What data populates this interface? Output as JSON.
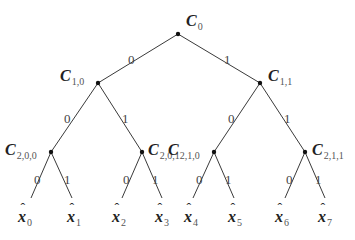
{
  "diagram": {
    "type": "binary-tree",
    "root": {
      "name": "C",
      "sub": "0",
      "x": 178,
      "y": 34,
      "lx": 186,
      "ly": 26
    },
    "level1": [
      {
        "name": "C",
        "sub": "1,0",
        "x": 98,
        "y": 83,
        "lx": 60,
        "ly": 81
      },
      {
        "name": "C",
        "sub": "1,1",
        "x": 260,
        "y": 83,
        "lx": 268,
        "ly": 81
      }
    ],
    "level2": [
      {
        "name": "C",
        "sub": "2,0,0",
        "x": 51,
        "y": 152,
        "lx": 5,
        "ly": 155
      },
      {
        "name": "C",
        "sub": "2,0,1",
        "x": 142,
        "y": 152,
        "lx": 148,
        "ly": 155
      },
      {
        "name": "C",
        "sub": "2,1,0",
        "x": 214,
        "y": 152,
        "lx": 168,
        "ly": 155
      },
      {
        "name": "C",
        "sub": "2,1,1",
        "x": 305,
        "y": 152,
        "lx": 312,
        "ly": 155
      }
    ],
    "leaves": [
      {
        "name": "x",
        "sub": "0",
        "x": 31,
        "y": 198,
        "lx": 18,
        "ly": 222
      },
      {
        "name": "x",
        "sub": "1",
        "x": 72,
        "y": 198,
        "lx": 67,
        "ly": 222
      },
      {
        "name": "x",
        "sub": "2",
        "x": 122,
        "y": 198,
        "lx": 112,
        "ly": 222
      },
      {
        "name": "x",
        "sub": "3",
        "x": 162,
        "y": 198,
        "lx": 155,
        "ly": 222
      },
      {
        "name": "x",
        "sub": "4",
        "x": 193,
        "y": 198,
        "lx": 184,
        "ly": 222
      },
      {
        "name": "x",
        "sub": "5",
        "x": 234,
        "y": 198,
        "lx": 228,
        "ly": 222
      },
      {
        "name": "x",
        "sub": "6",
        "x": 285,
        "y": 198,
        "lx": 275,
        "ly": 222
      },
      {
        "name": "x",
        "sub": "7",
        "x": 325,
        "y": 198,
        "lx": 318,
        "ly": 222
      }
    ],
    "edge_labels": [
      {
        "text": "0",
        "x": 128,
        "y": 64
      },
      {
        "text": "1",
        "x": 224,
        "y": 64
      },
      {
        "text": "0",
        "x": 64,
        "y": 123
      },
      {
        "text": "1",
        "x": 122,
        "y": 123
      },
      {
        "text": "0",
        "x": 228,
        "y": 123
      },
      {
        "text": "1",
        "x": 284,
        "y": 123
      },
      {
        "text": "0",
        "x": 34,
        "y": 184
      },
      {
        "text": "1",
        "x": 64,
        "y": 184
      },
      {
        "text": "0",
        "x": 123,
        "y": 184
      },
      {
        "text": "1",
        "x": 152,
        "y": 184
      },
      {
        "text": "0",
        "x": 196,
        "y": 184
      },
      {
        "text": "1",
        "x": 225,
        "y": 184
      },
      {
        "text": "0",
        "x": 286,
        "y": 184
      },
      {
        "text": "1",
        "x": 315,
        "y": 184
      }
    ]
  }
}
